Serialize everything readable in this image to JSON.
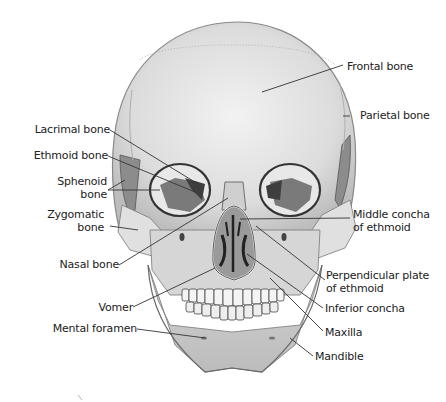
{
  "figure": {
    "labels_left": [
      {
        "id": "lacrimal",
        "text": "Lacrimal bone"
      },
      {
        "id": "ethmoid",
        "text": "Ethmoid  bone"
      },
      {
        "id": "sphenoid_1",
        "text": "Sphenoid"
      },
      {
        "id": "sphenoid_2",
        "text": "bone"
      },
      {
        "id": "zygomatic_1",
        "text": "Zygomatic"
      },
      {
        "id": "zygomatic_2",
        "text": "bone"
      },
      {
        "id": "nasal",
        "text": "Nasal bone"
      },
      {
        "id": "vomer",
        "text": "Vomer"
      },
      {
        "id": "mental",
        "text": "Mental foramen"
      }
    ],
    "labels_right": [
      {
        "id": "frontal",
        "text": "Frontal bone"
      },
      {
        "id": "parietal",
        "text": "Parietal bone"
      },
      {
        "id": "middle_concha_1",
        "text": "Middle concha"
      },
      {
        "id": "middle_concha_2",
        "text": "of ethmoid"
      },
      {
        "id": "perpendicular_1",
        "text": "Perpendicular plate"
      },
      {
        "id": "perpendicular_2",
        "text": "of ethmoid"
      },
      {
        "id": "inferior_concha",
        "text": "Inferior concha"
      },
      {
        "id": "maxilla",
        "text": "Maxilla"
      },
      {
        "id": "mandible",
        "text": "Mandible"
      }
    ]
  },
  "colors": {
    "bone_light": "#e6e6e6",
    "bone_mid": "#c8c8c8",
    "bone_dark": "#8a8a8a",
    "cavity": "#555555",
    "outline": "#3a3a3a",
    "leader": "#333333"
  }
}
